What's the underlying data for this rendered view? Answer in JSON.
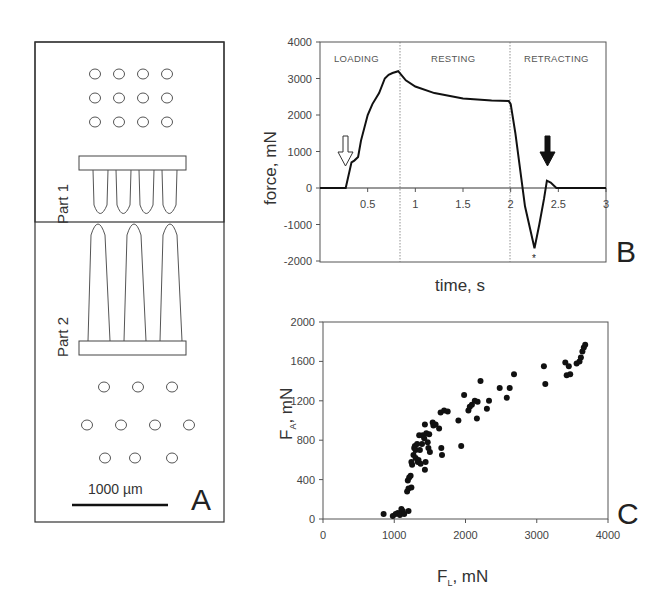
{
  "panel_a": {
    "label": "A",
    "part1_label": "Part 1",
    "part2_label": "Part 2",
    "scale_bar_label": "1000 µm",
    "top_holes_rows": 3,
    "top_holes_cols": 4,
    "bottom_holes_pattern": [
      3,
      4,
      3
    ]
  },
  "panel_b": {
    "label": "B",
    "ylabel": "force, mN",
    "xlabel": "time, s",
    "phases": [
      "LOADING",
      "RESTING",
      "RETRACTING"
    ],
    "yticks": [
      "4000",
      "3000",
      "2000",
      "1000",
      "0",
      "-1000",
      "-2000"
    ],
    "xticks": [
      "0.5",
      "1",
      "1.5",
      "2",
      "2.5",
      "3"
    ],
    "star_marker": "*"
  },
  "panel_c": {
    "label": "C",
    "ylabel_main": "F",
    "ylabel_sub": "A",
    "ylabel_unit": ", mN",
    "xlabel_main": "F",
    "xlabel_sub": "L",
    "xlabel_unit": ", mN",
    "yticks": [
      "2000",
      "1600",
      "1200",
      "800",
      "400",
      "0"
    ],
    "xticks": [
      "0",
      "1000",
      "2000",
      "3000",
      "4000"
    ]
  },
  "chart_data": [
    {
      "type": "line",
      "title": "B",
      "xlabel": "time, s",
      "ylabel": "force, mN",
      "xlim": [
        0,
        3
      ],
      "ylim": [
        -2000,
        4000
      ],
      "grid": false,
      "phase_boundaries": [
        0.82,
        2.0
      ],
      "phase_labels": [
        "LOADING",
        "RESTING",
        "RETRACTING"
      ],
      "annotations": [
        {
          "type": "open-arrow-down",
          "x": 0.25,
          "y": 700
        },
        {
          "type": "filled-arrow-down",
          "x": 2.37,
          "y": 500
        },
        {
          "type": "star",
          "x": 2.25,
          "y": -1950
        }
      ],
      "series": [
        {
          "name": "force",
          "x": [
            0,
            0.27,
            0.33,
            0.36,
            0.4,
            0.43,
            0.5,
            0.55,
            0.62,
            0.68,
            0.72,
            0.76,
            0.82,
            0.9,
            1.0,
            1.2,
            1.5,
            1.8,
            1.98,
            2.0,
            2.05,
            2.15,
            2.25,
            2.3,
            2.35,
            2.38,
            2.42,
            2.48,
            3.0
          ],
          "y": [
            0,
            0,
            700,
            750,
            850,
            1300,
            2000,
            2300,
            2600,
            3000,
            3100,
            3150,
            3200,
            2950,
            2780,
            2600,
            2450,
            2400,
            2380,
            2300,
            1500,
            -500,
            -1650,
            -1000,
            -300,
            200,
            150,
            0,
            0
          ]
        }
      ]
    },
    {
      "type": "scatter",
      "title": "C",
      "xlabel": "F_L, mN",
      "ylabel": "F_A, mN",
      "xlim": [
        0,
        4000
      ],
      "ylim": [
        0,
        2000
      ],
      "grid": false,
      "series": [
        {
          "name": "F_A vs F_L",
          "points": [
            [
              850,
              50
            ],
            [
              980,
              30
            ],
            [
              1020,
              50
            ],
            [
              1050,
              60
            ],
            [
              1080,
              40
            ],
            [
              1100,
              100
            ],
            [
              1120,
              80
            ],
            [
              1140,
              50
            ],
            [
              1200,
              80
            ],
            [
              1180,
              280
            ],
            [
              1200,
              310
            ],
            [
              1190,
              390
            ],
            [
              1210,
              420
            ],
            [
              1230,
              440
            ],
            [
              1240,
              320
            ],
            [
              1250,
              550
            ],
            [
              1240,
              580
            ],
            [
              1270,
              650
            ],
            [
              1280,
              720
            ],
            [
              1290,
              740
            ],
            [
              1300,
              700
            ],
            [
              1300,
              620
            ],
            [
              1320,
              760
            ],
            [
              1330,
              580
            ],
            [
              1340,
              600
            ],
            [
              1350,
              850
            ],
            [
              1360,
              700
            ],
            [
              1370,
              560
            ],
            [
              1390,
              760
            ],
            [
              1400,
              850
            ],
            [
              1420,
              820
            ],
            [
              1430,
              960
            ],
            [
              1430,
              500
            ],
            [
              1440,
              580
            ],
            [
              1450,
              870
            ],
            [
              1470,
              780
            ],
            [
              1480,
              720
            ],
            [
              1490,
              860
            ],
            [
              1500,
              680
            ],
            [
              1540,
              980
            ],
            [
              1550,
              950
            ],
            [
              1580,
              960
            ],
            [
              1630,
              920
            ],
            [
              1650,
              1080
            ],
            [
              1660,
              720
            ],
            [
              1670,
              650
            ],
            [
              1700,
              1100
            ],
            [
              1750,
              1090
            ],
            [
              1900,
              1000
            ],
            [
              1940,
              740
            ],
            [
              1980,
              1260
            ],
            [
              2040,
              1100
            ],
            [
              2060,
              1140
            ],
            [
              2090,
              1160
            ],
            [
              2130,
              1200
            ],
            [
              2160,
              1020
            ],
            [
              2170,
              1190
            ],
            [
              2210,
              1400
            ],
            [
              2300,
              1120
            ],
            [
              2330,
              1200
            ],
            [
              2480,
              1330
            ],
            [
              2580,
              1230
            ],
            [
              2620,
              1330
            ],
            [
              2680,
              1470
            ],
            [
              3100,
              1550
            ],
            [
              3120,
              1370
            ],
            [
              3400,
              1590
            ],
            [
              3420,
              1460
            ],
            [
              3450,
              1550
            ],
            [
              3470,
              1470
            ],
            [
              3560,
              1580
            ],
            [
              3600,
              1600
            ],
            [
              3620,
              1640
            ],
            [
              3640,
              1700
            ],
            [
              3660,
              1740
            ],
            [
              3680,
              1770
            ]
          ]
        }
      ]
    }
  ]
}
